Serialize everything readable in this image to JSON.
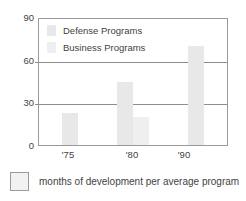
{
  "chart_data": {
    "type": "bar",
    "title": "",
    "xlabel": "",
    "ylabel": "",
    "categories": [
      "'75",
      "'80",
      "'90"
    ],
    "series": [
      {
        "name": "Defense Programs",
        "values": [
          23,
          45,
          71
        ]
      },
      {
        "name": "Business Programs",
        "values": [
          null,
          20,
          null
        ]
      }
    ],
    "ylim": [
      0,
      90
    ],
    "yticks": [
      0,
      30,
      60,
      90
    ],
    "ytick_labels": [
      "0",
      "30",
      "60",
      "90"
    ],
    "gridlines": [
      30,
      60
    ],
    "grid": true,
    "legend_position": "inside-top-left",
    "colors": {
      "defense": "#e8e8e8",
      "business": "#efefef",
      "axis": "#9a9a9a",
      "grid": "#8d8d8d",
      "text": "#3f3f3f"
    }
  },
  "legend": {
    "entries": [
      {
        "label": "Defense Programs",
        "swatch": "defense"
      },
      {
        "label": "Business Programs",
        "swatch": "business"
      }
    ]
  },
  "caption": {
    "swatch_name": "legend-swatch-box",
    "text": "months of development per average program"
  },
  "title_strip": {
    "text": ""
  }
}
